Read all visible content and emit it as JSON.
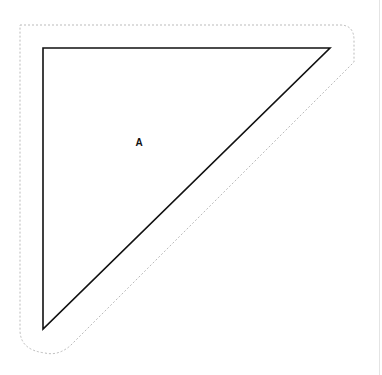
{
  "diagram": {
    "shapes": [
      {
        "id": "triangle-A",
        "type": "right-triangle",
        "label": "A",
        "vertices": [
          [
            43,
            48
          ],
          [
            330,
            48
          ],
          [
            43,
            329
          ]
        ],
        "stroke": "#111111",
        "fill": "#ffffff",
        "label_position": [
          139,
          142
        ],
        "selection_outline": {
          "style": "dotted",
          "color": "#bbbbbb"
        }
      }
    ]
  },
  "colors": {
    "background": "#ffffff",
    "stroke": "#111111",
    "selection": "#bbbbbb",
    "rule": "#e4e4e4"
  }
}
